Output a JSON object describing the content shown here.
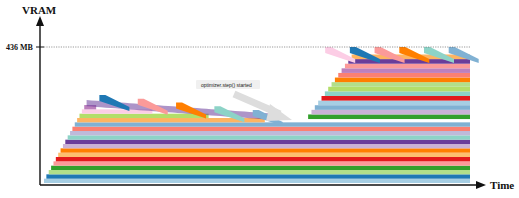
{
  "chart_data": {
    "type": "area",
    "title": "",
    "xlabel": "Time",
    "ylabel": "VRAM",
    "ylim": [
      0,
      436
    ],
    "y_unit": "MB",
    "ticks": [
      {
        "value": 436,
        "label": "436 MB"
      }
    ],
    "annotation": {
      "text": "optimizer.step() started",
      "at_time": 0.62
    },
    "phases": [
      {
        "name": "forward",
        "start": 0.0,
        "end": 0.1,
        "peak_mb": 250
      },
      {
        "name": "backward",
        "start": 0.1,
        "end": 0.55,
        "peak_mb": 270,
        "end_mb": 205
      },
      {
        "name": "optimizer",
        "start": 0.62,
        "end": 0.73,
        "peak_mb": 436
      },
      {
        "name": "steady",
        "start": 0.73,
        "end": 1.0,
        "peak_mb": 436
      }
    ],
    "layer_count": 18,
    "palette": [
      "#a6cee3",
      "#1f78b4",
      "#b2df8a",
      "#33a02c",
      "#fb9a99",
      "#e31a1c",
      "#fdbf6f",
      "#ff7f00",
      "#cab2d6",
      "#6a3d9a",
      "#8dd3c7",
      "#bebada",
      "#fb8072",
      "#80b1d3",
      "#fdb462",
      "#b3de69",
      "#fccde5",
      "#bc80bd"
    ]
  }
}
